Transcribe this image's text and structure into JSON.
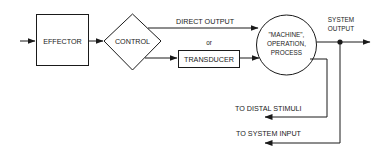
{
  "diagram": {
    "nodes": {
      "effector": {
        "label": "EFFECTOR"
      },
      "control": {
        "label": "CONTROL"
      },
      "transducer": {
        "label": "TRANSDUCER"
      },
      "machine": {
        "line1": "\"MACHINE\",",
        "line2": "OPERATION,",
        "line3": "PROCESS"
      }
    },
    "edges": {
      "direct_output": {
        "label": "DIRECT OUTPUT"
      },
      "or_label": {
        "label": "or"
      },
      "system_output": {
        "line1": "SYSTEM",
        "line2": "OUTPUT"
      },
      "to_distal_stimuli": {
        "label": "TO DISTAL STIMULI"
      },
      "to_system_input": {
        "label": "TO SYSTEM INPUT"
      }
    },
    "colors": {
      "stroke": "#1a1a1a",
      "background": "#ffffff"
    }
  }
}
